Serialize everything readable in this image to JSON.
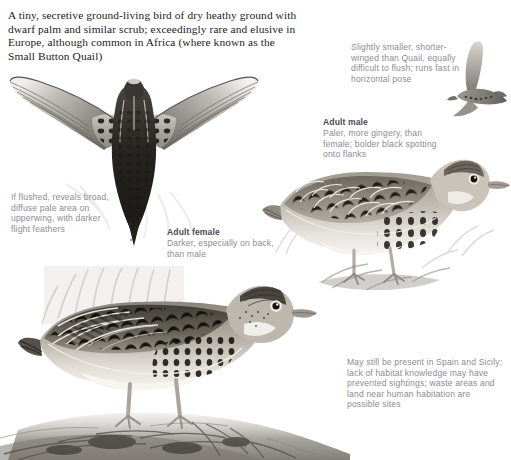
{
  "plate": {
    "intro_text": "A tiny, secretive ground-living bird of dry heathy ground with dwarf palm and similar scrub; exceedingly rare and elusive in Europe, although common in Africa (where known as the Small Button Quail)",
    "background_color": "#ffffff",
    "ink_color": "#1b1b1b",
    "caption_color": "#8c8c93",
    "caption_heading_color": "#4a4a52"
  },
  "notes": {
    "flight": {
      "heading": "",
      "body": "Slightly smaller, shorter-winged than Quail, equally difficult to flush; runs fast in horizontal pose"
    },
    "male": {
      "heading": "Adult male",
      "body": "Paler, more gingery, than female; bolder black spotting onto flanks"
    },
    "flushed": {
      "heading": "",
      "body": "If flushed, reveals broad, diffuse pale area on upperwing, with darker flight feathers"
    },
    "female": {
      "heading": "Adult female",
      "body": "Darker, especially on back, than male"
    },
    "range": {
      "heading": "",
      "body": "May still be present in Spain and Sicily; lack of habitat knowledge may have prevented sightings; waste areas and land near human habitation are possible sites"
    }
  },
  "figures": {
    "flight_silhouette": {
      "name": "flying-quail-side-view",
      "pose": "in flight, side view, wings raised"
    },
    "flying_upperwing": {
      "name": "flying-quail-from-above",
      "pose": "in flight from above, wings spread, showing pale upperwing panel"
    },
    "adult_male": {
      "name": "adult-male-standing",
      "pose": "standing upright, facing right"
    },
    "adult_female": {
      "name": "adult-female-crouching",
      "pose": "crouched horizontal, facing right, among grass"
    }
  }
}
